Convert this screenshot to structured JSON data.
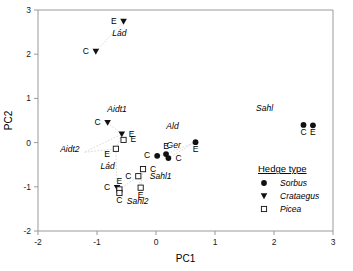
{
  "chart_data": {
    "type": "scatter",
    "title": "",
    "xlabel": "PC1",
    "ylabel": "PC2",
    "xlim": [
      -2,
      3
    ],
    "ylim": [
      -2,
      3
    ],
    "xticks": [
      -2,
      -1,
      0,
      1,
      2,
      3
    ],
    "yticks": [
      -2,
      -1,
      0,
      1,
      2,
      3
    ],
    "xticklabels": [
      "-2",
      "-1",
      "0",
      "1",
      "2",
      "3"
    ],
    "yticklabels": [
      "-2",
      "-1",
      "0",
      "1",
      "2",
      "3"
    ],
    "grid": false,
    "legend": {
      "title": "Hedge type",
      "position": "lower-right",
      "entries": [
        {
          "label": "Sorbus",
          "marker": "filled-circle"
        },
        {
          "label": "Crataegus",
          "marker": "filled-triangle-down"
        },
        {
          "label": "Picea",
          "marker": "open-square"
        }
      ]
    },
    "group_labels": [
      {
        "text": "Lád",
        "x": -0.62,
        "y": 2.42
      },
      {
        "text": "Aidt1",
        "x": -0.66,
        "y": 0.69
      },
      {
        "text": "Aidt2",
        "x": -1.46,
        "y": -0.22
      },
      {
        "text": "Lád",
        "x": -0.82,
        "y": -0.59
      },
      {
        "text": "Sahl1",
        "x": 0.08,
        "y": -0.83
      },
      {
        "text": "Sahl2",
        "x": -0.31,
        "y": -1.38
      },
      {
        "text": "Ald",
        "x": 0.28,
        "y": 0.3
      },
      {
        "text": "Ger",
        "x": 0.3,
        "y": -0.12
      },
      {
        "text": "Sahl",
        "x": 1.84,
        "y": 0.72
      }
    ],
    "connectors": [
      [
        [
          -1.02,
          2.06
        ],
        [
          -0.55,
          2.74
        ]
      ],
      [
        [
          -0.82,
          0.45
        ],
        [
          -0.58,
          0.19
        ],
        [
          -1.22,
          -0.22
        ],
        [
          -0.68,
          -0.14
        ],
        [
          -0.58,
          0.19
        ]
      ],
      [
        [
          -0.68,
          -0.14
        ],
        [
          -0.66,
          -1.02
        ],
        [
          -0.62,
          -1.06
        ],
        [
          -0.3,
          -0.76
        ],
        [
          -0.26,
          -1.02
        ],
        [
          -0.22,
          -0.6
        ],
        [
          -0.3,
          -0.76
        ]
      ],
      [
        [
          0.02,
          -0.3
        ],
        [
          0.17,
          -0.26
        ],
        [
          0.21,
          -0.35
        ],
        [
          0.67,
          0.01
        ],
        [
          0.17,
          -0.26
        ]
      ]
    ],
    "series": [
      {
        "name": "Sorbus",
        "marker": "filled-circle",
        "points": [
          {
            "x": 0.02,
            "y": -0.3,
            "label": "C",
            "label_pos": "left"
          },
          {
            "x": 0.17,
            "y": -0.26,
            "label": "E",
            "label_pos": "above"
          },
          {
            "x": 0.21,
            "y": -0.35,
            "label": "C",
            "label_pos": "right"
          },
          {
            "x": 0.67,
            "y": 0.01,
            "label": "E",
            "label_pos": "below"
          },
          {
            "x": 2.5,
            "y": 0.4,
            "label": "C",
            "label_pos": "below"
          },
          {
            "x": 2.66,
            "y": 0.39,
            "label": "E",
            "label_pos": "below"
          }
        ]
      },
      {
        "name": "Crataegus",
        "marker": "filled-triangle-down",
        "points": [
          {
            "x": -0.55,
            "y": 2.74,
            "label": "E",
            "label_pos": "left"
          },
          {
            "x": -1.02,
            "y": 2.06,
            "label": "C",
            "label_pos": "left"
          },
          {
            "x": -0.82,
            "y": 0.45,
            "label": "C",
            "label_pos": "left"
          },
          {
            "x": -0.58,
            "y": 0.19,
            "label": "E",
            "label_pos": "right"
          },
          {
            "x": -0.66,
            "y": -1.02,
            "label": "C",
            "label_pos": "left"
          }
        ]
      },
      {
        "name": "Picea",
        "marker": "open-square",
        "points": [
          {
            "x": -0.68,
            "y": -0.14,
            "label": "E",
            "label_pos": "belowleft"
          },
          {
            "x": -0.55,
            "y": 0.06,
            "label": "E",
            "label_pos": "right"
          },
          {
            "x": -0.3,
            "y": -0.76,
            "label": "C",
            "label_pos": "left"
          },
          {
            "x": -0.62,
            "y": -1.06,
            "label": "E",
            "label_pos": "above"
          },
          {
            "x": -0.62,
            "y": -1.14,
            "label": "C",
            "label_pos": "below"
          },
          {
            "x": -0.26,
            "y": -1.02,
            "label": "E",
            "label_pos": "below"
          },
          {
            "x": -0.22,
            "y": -0.6,
            "label": "C",
            "label_pos": "right"
          }
        ]
      }
    ]
  }
}
